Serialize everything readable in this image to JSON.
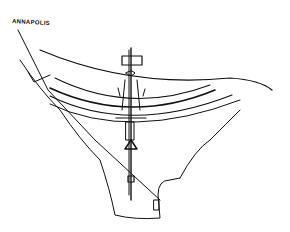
{
  "sketch": {
    "label": "ANNAPOLIS",
    "ink_color": "#111111",
    "background": "#ffffff"
  }
}
